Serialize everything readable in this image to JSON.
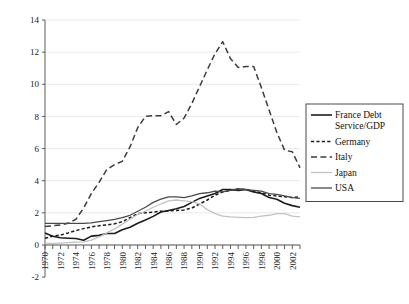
{
  "chart_data": {
    "type": "line",
    "title": "",
    "xlabel": "",
    "ylabel": "",
    "xlim": [
      1970,
      2003
    ],
    "ylim": [
      -2,
      14
    ],
    "ytick_values": [
      -2,
      0,
      2,
      4,
      6,
      8,
      10,
      12,
      14
    ],
    "ytick_labels": [
      "-2",
      "0",
      "2",
      "4",
      "6",
      "8",
      "10",
      "12",
      "14"
    ],
    "xtick_values": [
      1970,
      1972,
      1974,
      1976,
      1978,
      1980,
      1982,
      1984,
      1986,
      1988,
      1990,
      1992,
      1994,
      1996,
      1998,
      2000,
      2002
    ],
    "xtick_labels": [
      "1970",
      "1972",
      "1974",
      "1976",
      "1978",
      "1980",
      "1982",
      "1984",
      "1986",
      "1988",
      "1990",
      "1992",
      "1994",
      "1996",
      "1998",
      "2000",
      "2002"
    ],
    "xtick_label_rotation": -90,
    "grid": "horizontal",
    "legend_position": "right",
    "x": [
      1970,
      1971,
      1972,
      1973,
      1974,
      1975,
      1976,
      1977,
      1978,
      1979,
      1980,
      1981,
      1982,
      1983,
      1984,
      1985,
      1986,
      1987,
      1988,
      1989,
      1990,
      1991,
      1992,
      1993,
      1994,
      1995,
      1996,
      1997,
      1998,
      1999,
      2000,
      2001,
      2002,
      2003
    ],
    "series": [
      {
        "name": "France Debt Service/GDP",
        "legend_label_line1": "France Debt",
        "legend_label_line2": "Service/GDP",
        "style": "solid",
        "color": "#1c1c1c",
        "width": 1.6,
        "values": [
          0.75,
          0.55,
          0.45,
          0.42,
          0.4,
          0.3,
          0.55,
          0.6,
          0.72,
          0.72,
          0.95,
          1.1,
          1.35,
          1.55,
          1.78,
          2.05,
          2.15,
          2.25,
          2.4,
          2.65,
          2.9,
          3.05,
          3.2,
          3.45,
          3.45,
          3.4,
          3.45,
          3.3,
          3.2,
          2.95,
          2.85,
          2.6,
          2.45,
          2.35
        ]
      },
      {
        "name": "Germany",
        "legend_label_line1": "Germany",
        "legend_label_line2": "",
        "style": "dashed",
        "color": "#1c1c1c",
        "width": 1.5,
        "values": [
          0.42,
          0.55,
          0.62,
          0.75,
          0.9,
          1.02,
          1.12,
          1.2,
          1.25,
          1.32,
          1.45,
          1.7,
          1.95,
          2.0,
          2.05,
          2.1,
          2.12,
          2.15,
          2.18,
          2.3,
          2.55,
          2.8,
          3.1,
          3.3,
          3.4,
          3.5,
          3.45,
          3.35,
          3.25,
          3.1,
          3.05,
          3.0,
          2.95,
          3.0
        ]
      },
      {
        "name": "Italy",
        "legend_label_line1": "Italy",
        "legend_label_line2": "",
        "style": "longdash",
        "color": "#3d3d3d",
        "width": 1.5,
        "values": [
          1.15,
          1.2,
          1.25,
          1.35,
          1.6,
          2.3,
          3.2,
          3.9,
          4.7,
          5.0,
          5.2,
          6.1,
          7.3,
          8.0,
          8.05,
          8.05,
          8.3,
          7.5,
          7.9,
          8.8,
          9.85,
          10.9,
          11.9,
          12.65,
          11.6,
          11.05,
          11.1,
          11.1,
          9.8,
          8.4,
          7.0,
          5.9,
          5.8,
          4.8
        ]
      },
      {
        "name": "Japan",
        "legend_label_line1": "Japan",
        "legend_label_line2": "",
        "style": "solid",
        "color": "#c2c2c2",
        "width": 1.3,
        "values": [
          0.1,
          0.1,
          0.12,
          0.15,
          0.18,
          0.2,
          0.3,
          0.5,
          0.75,
          1.0,
          1.3,
          1.6,
          1.9,
          2.1,
          2.35,
          2.55,
          2.75,
          2.8,
          2.75,
          2.7,
          2.55,
          2.2,
          1.95,
          1.8,
          1.75,
          1.72,
          1.7,
          1.72,
          1.8,
          1.85,
          1.95,
          1.95,
          1.8,
          1.75
        ]
      },
      {
        "name": "USA",
        "legend_label_line1": "USA",
        "legend_label_line2": "",
        "style": "solid",
        "color": "#4a4a4a",
        "width": 1.3,
        "values": [
          1.35,
          1.35,
          1.35,
          1.35,
          1.35,
          1.35,
          1.38,
          1.45,
          1.52,
          1.6,
          1.7,
          1.85,
          2.1,
          2.35,
          2.65,
          2.85,
          3.0,
          3.0,
          2.95,
          3.05,
          3.2,
          3.25,
          3.35,
          3.3,
          3.4,
          3.5,
          3.45,
          3.4,
          3.35,
          3.2,
          3.15,
          3.05,
          2.95,
          2.9
        ]
      }
    ]
  },
  "legend": {
    "entries": [
      {
        "label": "France Debt",
        "label2": "Service/GDP"
      },
      {
        "label": "Germany",
        "label2": ""
      },
      {
        "label": "Italy",
        "label2": ""
      },
      {
        "label": "Japan",
        "label2": ""
      },
      {
        "label": "USA",
        "label2": ""
      }
    ]
  }
}
